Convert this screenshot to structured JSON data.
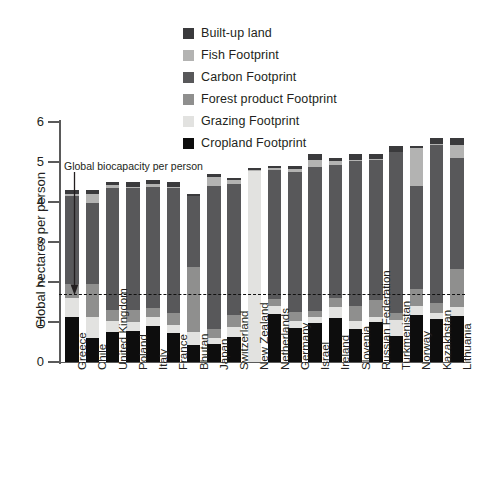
{
  "chart_data": {
    "type": "bar",
    "subtype": "stacked-bar",
    "title": "",
    "xlabel": "",
    "ylabel": "Global hectares per person",
    "ylim": [
      0,
      6
    ],
    "yticks": [
      0,
      1,
      2,
      3,
      4,
      5,
      6
    ],
    "grid": false,
    "legend_position": "top-center",
    "categories": [
      "Greece",
      "Chile",
      "United Kingdom",
      "Poland",
      "Italy",
      "France",
      "Bhutan",
      "Japan",
      "Switzerland",
      "New Zealand",
      "Netherlands",
      "Germany",
      "Israel",
      "Ireland",
      "Slovenia",
      "Russian Federation",
      "Turkmenistan",
      "Norway",
      "Kazakhstan",
      "Lithuania"
    ],
    "series": [
      {
        "name": "Cropland Footprint",
        "color": "#0d0d0d",
        "values": [
          1.12,
          0.6,
          0.74,
          0.78,
          0.9,
          0.72,
          0.43,
          0.46,
          0.62,
          0.0,
          1.2,
          0.86,
          0.98,
          1.09,
          0.82,
          1.0,
          0.64,
          1.18,
          1.08,
          1.15
        ]
      },
      {
        "name": "Grazing Footprint",
        "color": "#e2e2e0",
        "values": [
          0.48,
          0.52,
          0.28,
          0.22,
          0.22,
          0.2,
          0.32,
          0.14,
          0.26,
          4.78,
          0.2,
          0.16,
          0.14,
          0.28,
          0.2,
          0.12,
          0.4,
          0.22,
          0.14,
          0.22
        ]
      },
      {
        "name": "Forest product Footprint",
        "color": "#8f8f8e",
        "values": [
          0.34,
          0.84,
          0.28,
          0.3,
          0.24,
          0.3,
          1.62,
          0.22,
          0.3,
          0.0,
          0.18,
          0.24,
          0.16,
          0.22,
          0.38,
          0.44,
          0.18,
          0.42,
          0.26,
          0.96
        ]
      },
      {
        "name": "Carbon Footprint",
        "color": "#58585a",
        "values": [
          2.22,
          2.02,
          3.06,
          3.06,
          3.02,
          3.12,
          1.78,
          3.58,
          3.26,
          0.0,
          3.22,
          3.5,
          3.6,
          3.34,
          3.62,
          3.48,
          4.02,
          2.58,
          3.94,
          2.76
        ]
      },
      {
        "name": "Fish Footprint",
        "color": "#b3b3b2",
        "values": [
          0.04,
          0.22,
          0.06,
          0.02,
          0.06,
          0.04,
          0.0,
          0.22,
          0.1,
          0.02,
          0.04,
          0.06,
          0.16,
          0.1,
          0.04,
          0.04,
          0.0,
          0.94,
          0.02,
          0.34
        ]
      },
      {
        "name": "Built-up land",
        "color": "#3a3a3c",
        "values": [
          0.1,
          0.1,
          0.08,
          0.12,
          0.1,
          0.12,
          0.05,
          0.08,
          0.06,
          0.06,
          0.06,
          0.08,
          0.16,
          0.07,
          0.14,
          0.12,
          0.16,
          0.06,
          0.16,
          0.17
        ]
      }
    ],
    "annotations": [
      {
        "name": "global-biocapacity",
        "label": "Global biocapacity per person",
        "value": 1.7,
        "style": "dashed-horizontal-line-with-arrow"
      }
    ]
  },
  "legend": {
    "items": [
      {
        "label": "Built-up land",
        "color": "#3a3a3c"
      },
      {
        "label": "Fish Footprint",
        "color": "#b3b3b2"
      },
      {
        "label": "Carbon Footprint",
        "color": "#58585a"
      },
      {
        "label": "Forest product Footprint",
        "color": "#8f8f8e"
      },
      {
        "label": "Grazing Footprint",
        "color": "#e2e2e0"
      },
      {
        "label": "Cropland Footprint",
        "color": "#0d0d0d"
      }
    ]
  },
  "axes": {
    "y_title": "Global hectares per person",
    "y_tick_labels": [
      "0",
      "1",
      "2",
      "3",
      "4",
      "5",
      "6"
    ]
  }
}
